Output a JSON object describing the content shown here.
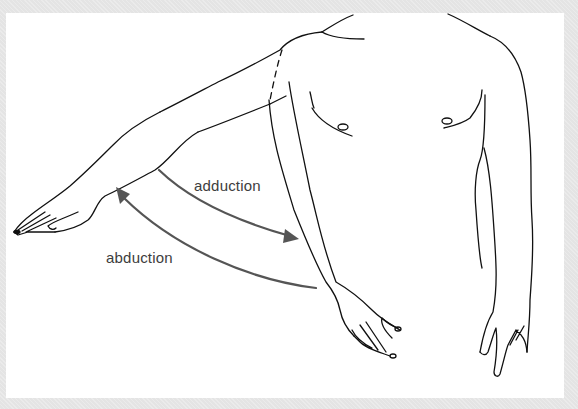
{
  "diagram": {
    "labels": {
      "adduction": "adduction",
      "abduction": "abduction"
    },
    "colors": {
      "frame": "#e4e4e4",
      "panel": "#ffffff",
      "outline": "#111111",
      "arrow": "#555555",
      "label_text": "#3d3d3d"
    },
    "arrows": [
      {
        "name": "adduction-arrow",
        "direction": "toward body (down-right)"
      },
      {
        "name": "abduction-arrow",
        "direction": "away from body (up-left)"
      }
    ]
  }
}
